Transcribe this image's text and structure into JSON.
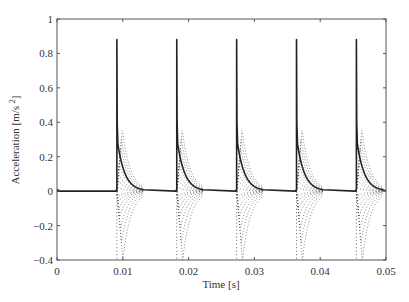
{
  "chart_data": {
    "type": "line",
    "title": "",
    "xlabel": "Time [s]",
    "ylabel": "Acceleration [m/s^2]",
    "xlim": [
      0,
      0.05
    ],
    "ylim": [
      -0.4,
      1.0
    ],
    "xticks": [
      "0",
      "0.01",
      "0.02",
      "0.03",
      "0.04",
      "0.05"
    ],
    "yticks": [
      "−0.4",
      "−0.2",
      "0",
      "0.2",
      "0.4",
      "0.6",
      "0.8",
      "1"
    ],
    "grid": false,
    "legend": null,
    "pulse_times": [
      0.0091,
      0.0182,
      0.0273,
      0.0364,
      0.0455
    ],
    "series": [
      {
        "name": "solid response",
        "style": "solid",
        "description": "Periodic impulses: sharp spike to ~0.88 at each pulse time, then exponential decay from ~0.3 back to ~0 within ~0.004 s",
        "peak": 0.88,
        "decay_start": 0.3,
        "baseline": 0.0
      },
      {
        "name": "dotted components",
        "style": "dotted",
        "description": "Family of dotted curves fanning from the pulse time; lowest reaches about -0.4 and all converge to 0 within ~0.004 s",
        "min": -0.4,
        "max": 0.4
      }
    ]
  }
}
